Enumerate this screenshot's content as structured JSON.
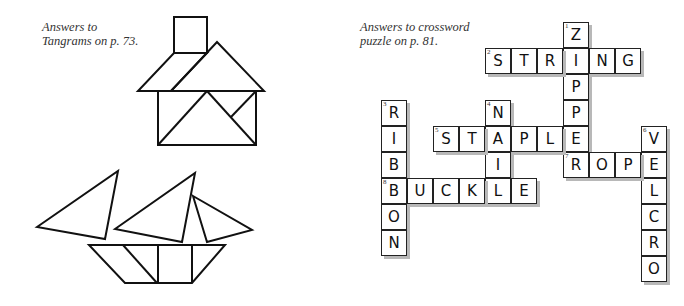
{
  "tangrams": {
    "caption_lines": [
      "Answers to",
      "Tangrams on p. 73."
    ],
    "figures": [
      "house",
      "sailboat"
    ]
  },
  "crossword": {
    "caption_lines": [
      "Answers to crossword",
      "puzzle on p. 81."
    ],
    "origin": {
      "x": 381,
      "y": 22
    },
    "cell_size": 26,
    "entries": [
      {
        "number": "1",
        "answer": "ZIPPER",
        "direction": "down",
        "col": 7,
        "row": 0
      },
      {
        "number": "2",
        "answer": "STRING",
        "direction": "across",
        "col": 4,
        "row": 1
      },
      {
        "number": "3",
        "answer": "RIBBON",
        "direction": "down",
        "col": 0,
        "row": 3
      },
      {
        "number": "4",
        "answer": "NAIL",
        "direction": "down",
        "col": 4,
        "row": 3
      },
      {
        "number": "5",
        "answer": "STAPLE",
        "direction": "across",
        "col": 2,
        "row": 4
      },
      {
        "number": "6",
        "answer": "VELCRO",
        "direction": "down",
        "col": 10,
        "row": 4
      },
      {
        "number": "7",
        "answer": "ROPE",
        "direction": "across",
        "col": 7,
        "row": 5
      },
      {
        "number": "8",
        "answer": "BUCKLE",
        "direction": "across",
        "col": 0,
        "row": 6
      }
    ]
  }
}
